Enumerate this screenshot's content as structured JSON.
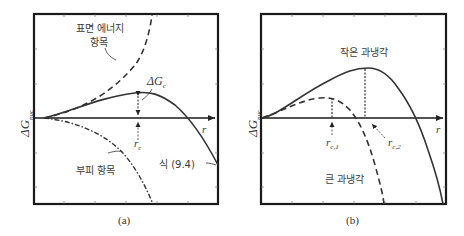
{
  "panel_a": {
    "caption": "(a)",
    "y_axis_label": "ΔG",
    "y_axis_sub": "nuc",
    "x_axis_label": "r",
    "surface_term_label_line1": "표면 에너지",
    "surface_term_label_line2": "항목",
    "volume_term_label": "부피 항목",
    "equation_label": "식 (9.4)",
    "barrier_label": "ΔG",
    "barrier_sub": "c",
    "critical_radius_label": "r",
    "critical_radius_sub": "c"
  },
  "panel_b": {
    "caption": "(b)",
    "y_axis_label": "ΔG",
    "y_axis_sub": "nuc",
    "x_axis_label": "r",
    "small_undercooling_label": "작은 과냉각",
    "large_undercooling_label": "큰 과냉각",
    "rc1_label": "r",
    "rc1_sub": "c,1",
    "rc2_label": "r",
    "rc2_sub": "c,2"
  },
  "colors": {
    "frame": "#1a1a1a",
    "curve": "#333333",
    "text": "#3a3a3a"
  }
}
